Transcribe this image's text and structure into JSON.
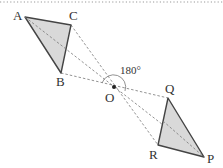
{
  "diagram": {
    "center": {
      "label": "O",
      "x": 114,
      "y": 87
    },
    "rotation_label": "180°",
    "triangle_abc": {
      "fill": "#d9d9d9",
      "stroke": "#444444",
      "vertices": [
        {
          "label": "A",
          "x": 25,
          "y": 17
        },
        {
          "label": "C",
          "x": 71,
          "y": 25
        },
        {
          "label": "B",
          "x": 61,
          "y": 73
        }
      ]
    },
    "triangle_pqr": {
      "fill": "#d9d9d9",
      "stroke": "#444444",
      "vertices": [
        {
          "label": "Q",
          "x": 168,
          "y": 98
        },
        {
          "label": "R",
          "x": 158,
          "y": 145
        },
        {
          "label": "P",
          "x": 204,
          "y": 157
        }
      ]
    },
    "correspondences": [
      {
        "from": "A",
        "to": "P"
      },
      {
        "from": "B",
        "to": "R"
      },
      {
        "from": "C",
        "to": "Q"
      }
    ],
    "line_color": "#777777"
  }
}
